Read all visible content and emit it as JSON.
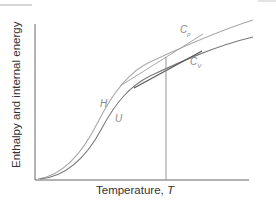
{
  "diagram": {
    "y_axis_label": "Enthalpy and internal energy",
    "x_axis_label": "Temperature,",
    "x_axis_symbol": "T",
    "curves": [
      {
        "name": "H",
        "label": "H",
        "color": "#a8a8a8",
        "description": "enthalpy"
      },
      {
        "name": "U",
        "label": "U",
        "color": "#6e6e6e",
        "description": "internal energy"
      }
    ],
    "tangents": [
      {
        "label_main": "C",
        "label_sub": "p",
        "curve": "H",
        "color": "#a0a0a0"
      },
      {
        "label_main": "C",
        "label_sub": "V",
        "curve": "U",
        "color": "#555555"
      }
    ],
    "marker": {
      "description": "vertical line at chosen temperature",
      "color": "#777777"
    },
    "colors": {
      "axis": "#555555",
      "text": "#333333",
      "label": "#8a8a8a"
    }
  }
}
